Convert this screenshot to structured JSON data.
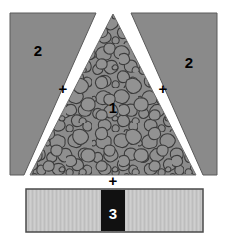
{
  "figure": {
    "canvas": {
      "width": 227,
      "height": 240,
      "background": "#ffffff"
    },
    "colors": {
      "side_wedge_fill": "#8a8a8a",
      "side_wedge_stroke": "#555555",
      "aggregate_base": "#8c8c8c",
      "aggregate_blob_fill": "#8f8f8f",
      "aggregate_blob_stroke": "#3c3c3c",
      "gap_white": "#ffffff",
      "bar_fill": "#c7c7c7",
      "bar_stroke": "#4a4a4a",
      "bar_band_fill": "#111111",
      "label_dark": "#000000",
      "label_light": "#ffffff"
    },
    "components": [
      {
        "id": "center-aggregate",
        "label": "1",
        "shape": "triangle",
        "texture": "aggregate-speckle",
        "label_color": "#000000",
        "label_x": 113,
        "label_y": 107
      },
      {
        "id": "left-wedge",
        "label": "2",
        "shape": "wedge",
        "texture": "solid",
        "label_color": "#000000",
        "label_x": 38,
        "label_y": 50
      },
      {
        "id": "right-wedge",
        "label": "2",
        "shape": "wedge",
        "texture": "solid",
        "label_color": "#000000",
        "label_x": 189,
        "label_y": 62
      },
      {
        "id": "bottom-bar-band",
        "label": "3",
        "shape": "rectangle",
        "texture": "solid",
        "label_color": "#ffffff",
        "label_x": 113,
        "label_y": 213
      }
    ],
    "operators": [
      {
        "id": "plus-left",
        "symbol": "+",
        "x": 63,
        "y": 89
      },
      {
        "id": "plus-right",
        "symbol": "+",
        "x": 163,
        "y": 89
      },
      {
        "id": "plus-bottom",
        "symbol": "+",
        "x": 113,
        "y": 181
      }
    ]
  }
}
